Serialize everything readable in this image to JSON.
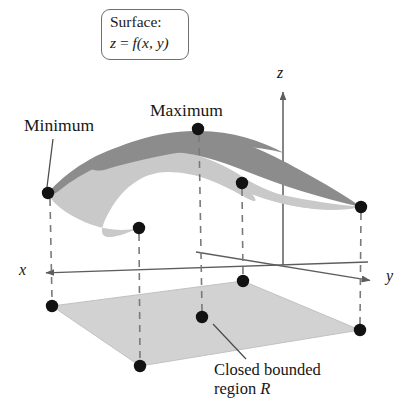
{
  "figure": {
    "title_box": {
      "line1": "Surface:",
      "line2_z": "z",
      "line2_eq": " = ",
      "line2_f": "f",
      "line2_args": "(x, y)"
    },
    "labels": {
      "minimum": "Minimum",
      "maximum": "Maximum",
      "axis_x": "x",
      "axis_y": "y",
      "axis_z": "z",
      "caption_line1": "Closed bounded",
      "caption_line2_pre": "region ",
      "caption_line2_r": "R"
    },
    "colors": {
      "surface_top": "#8c8c8c",
      "surface_under": "#c9c9c9",
      "region_fill": "#d2d2d2",
      "point": "#121212",
      "axis": "#5d5d5d",
      "dashed": "#7a7a7a",
      "box_border": "#6f6f6f",
      "background": "#ffffff"
    },
    "points": [
      {
        "name": "minimum-surface-point",
        "x": 48,
        "y": 193
      },
      {
        "name": "front-dip-surface-point",
        "x": 139,
        "y": 228
      },
      {
        "name": "maximum-surface-point",
        "x": 198,
        "y": 129
      },
      {
        "name": "saddle-surface-point",
        "x": 242,
        "y": 183
      },
      {
        "name": "right-surface-point",
        "x": 361,
        "y": 207
      },
      {
        "name": "region-corner-left",
        "x": 52,
        "y": 306
      },
      {
        "name": "region-corner-front",
        "x": 140,
        "y": 366
      },
      {
        "name": "region-interior-point",
        "x": 202,
        "y": 317
      },
      {
        "name": "region-corner-back",
        "x": 243,
        "y": 281
      },
      {
        "name": "region-corner-right",
        "x": 360,
        "y": 330
      }
    ],
    "region": {
      "name": "closed-bounded-region-R",
      "corners": [
        {
          "x": 52,
          "y": 306
        },
        {
          "x": 243,
          "y": 281
        },
        {
          "x": 360,
          "y": 330
        },
        {
          "x": 140,
          "y": 366
        }
      ]
    },
    "axes": {
      "x_axis": {
        "from": {
          "x": 368,
          "y": 262
        },
        "to": {
          "x": 42,
          "y": 273
        }
      },
      "y_axis": {
        "from": {
          "x": 196,
          "y": 252
        },
        "to": {
          "x": 374,
          "y": 281
        }
      },
      "z_axis": {
        "from": {
          "x": 283,
          "y": 260
        },
        "to": {
          "x": 283,
          "y": 88
        }
      }
    },
    "leaders": [
      {
        "name": "minimum-leader-line",
        "from": {
          "x": 52,
          "y": 137
        },
        "to": {
          "x": 47,
          "y": 189
        }
      },
      {
        "name": "maximum-leader-line",
        "from": {
          "x": 198,
          "y": 126
        },
        "to": {
          "x": 198,
          "y": 126
        }
      },
      {
        "name": "region-leader-line",
        "from": {
          "x": 245,
          "y": 358
        },
        "to": {
          "x": 214,
          "y": 325
        }
      }
    ]
  }
}
